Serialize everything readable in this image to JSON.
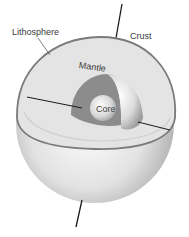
{
  "figure": {
    "labels": {
      "lithosphere": "Lithosphere",
      "crust": "Crust",
      "mantle": "Mantle",
      "core": "Core"
    }
  },
  "colors": {
    "background": "#ffffff",
    "cut_surface": "#e4e4e4",
    "mantle": "#8c8c8c",
    "shell_light": "#f4f4f4",
    "shell_dark": "#9a9a9a",
    "crust_rim": "#7a7a7a",
    "axis": "#1a1a1a",
    "text": "#3a3a3a"
  }
}
